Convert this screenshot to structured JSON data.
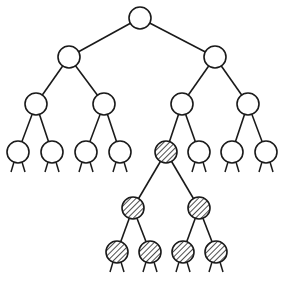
{
  "diagram": {
    "type": "binary-tree",
    "stroke_color": "#1a1a1a",
    "fill_color": "#ffffff",
    "hatch_color": "#222222",
    "node_radius": 11,
    "nodes": [
      {
        "id": "n0",
        "x": 140,
        "y": 18,
        "hatched": false
      },
      {
        "id": "n1",
        "x": 69,
        "y": 57,
        "hatched": false
      },
      {
        "id": "n2",
        "x": 215,
        "y": 57,
        "hatched": false
      },
      {
        "id": "n3",
        "x": 36,
        "y": 104,
        "hatched": false
      },
      {
        "id": "n4",
        "x": 104,
        "y": 104,
        "hatched": false
      },
      {
        "id": "n5",
        "x": 182,
        "y": 104,
        "hatched": false
      },
      {
        "id": "n6",
        "x": 248,
        "y": 104,
        "hatched": false
      },
      {
        "id": "n7",
        "x": 18,
        "y": 152,
        "hatched": false
      },
      {
        "id": "n8",
        "x": 52,
        "y": 152,
        "hatched": false
      },
      {
        "id": "n9",
        "x": 86,
        "y": 152,
        "hatched": false
      },
      {
        "id": "n10",
        "x": 120,
        "y": 152,
        "hatched": false
      },
      {
        "id": "n11",
        "x": 166,
        "y": 152,
        "hatched": true
      },
      {
        "id": "n12",
        "x": 199,
        "y": 152,
        "hatched": false
      },
      {
        "id": "n13",
        "x": 232,
        "y": 152,
        "hatched": false
      },
      {
        "id": "n14",
        "x": 266,
        "y": 152,
        "hatched": false
      },
      {
        "id": "n15",
        "x": 133,
        "y": 208,
        "hatched": true
      },
      {
        "id": "n16",
        "x": 199,
        "y": 208,
        "hatched": true
      },
      {
        "id": "n17",
        "x": 117,
        "y": 252,
        "hatched": true
      },
      {
        "id": "n18",
        "x": 150,
        "y": 252,
        "hatched": true
      },
      {
        "id": "n19",
        "x": 183,
        "y": 252,
        "hatched": true
      },
      {
        "id": "n20",
        "x": 216,
        "y": 252,
        "hatched": true
      }
    ],
    "edges": [
      [
        "n0",
        "n1"
      ],
      [
        "n0",
        "n2"
      ],
      [
        "n1",
        "n3"
      ],
      [
        "n1",
        "n4"
      ],
      [
        "n2",
        "n5"
      ],
      [
        "n2",
        "n6"
      ],
      [
        "n3",
        "n7"
      ],
      [
        "n3",
        "n8"
      ],
      [
        "n4",
        "n9"
      ],
      [
        "n4",
        "n10"
      ],
      [
        "n5",
        "n11"
      ],
      [
        "n5",
        "n12"
      ],
      [
        "n6",
        "n13"
      ],
      [
        "n6",
        "n14"
      ],
      [
        "n11",
        "n15"
      ],
      [
        "n11",
        "n16"
      ],
      [
        "n15",
        "n17"
      ],
      [
        "n15",
        "n18"
      ],
      [
        "n16",
        "n19"
      ],
      [
        "n16",
        "n20"
      ]
    ],
    "stub_leaves": [
      "n7",
      "n8",
      "n9",
      "n10",
      "n12",
      "n13",
      "n14",
      "n17",
      "n18",
      "n19",
      "n20"
    ]
  }
}
